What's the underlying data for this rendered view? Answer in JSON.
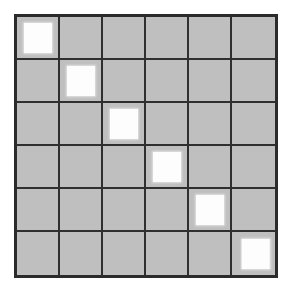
{
  "figure": {
    "name": "matrix-grid-figure",
    "type": "grid-matrix",
    "rows": 6,
    "cols": 6,
    "colors": {
      "page_background": "#ffffff",
      "cell_fill": "#bfbfbf",
      "grid_line": "#2f2f2f",
      "outer_border": "#2b2b2b",
      "marker_fill": "#fdfdfd"
    },
    "cells": [
      [
        1,
        0,
        0,
        0,
        0,
        0
      ],
      [
        0,
        1,
        0,
        0,
        0,
        0
      ],
      [
        0,
        0,
        1,
        0,
        0,
        0
      ],
      [
        0,
        0,
        0,
        1,
        0,
        0
      ],
      [
        0,
        0,
        0,
        0,
        1,
        0
      ],
      [
        0,
        0,
        0,
        0,
        0,
        1
      ]
    ]
  },
  "chart_data": {
    "type": "heatmap",
    "title": "",
    "xlabel": "",
    "ylabel": "",
    "categories_x": [
      "1",
      "2",
      "3",
      "4",
      "5",
      "6"
    ],
    "categories_y": [
      "1",
      "2",
      "3",
      "4",
      "5",
      "6"
    ],
    "values": [
      [
        1,
        0,
        0,
        0,
        0,
        0
      ],
      [
        0,
        1,
        0,
        0,
        0,
        0
      ],
      [
        0,
        0,
        1,
        0,
        0,
        0
      ],
      [
        0,
        0,
        0,
        1,
        0,
        0
      ],
      [
        0,
        0,
        0,
        0,
        1,
        0
      ],
      [
        0,
        0,
        0,
        0,
        0,
        1
      ]
    ],
    "value_colors": {
      "0": "#bfbfbf",
      "1": "#fdfdfd"
    },
    "grid": true,
    "legend": "none",
    "tick_labels": false
  }
}
